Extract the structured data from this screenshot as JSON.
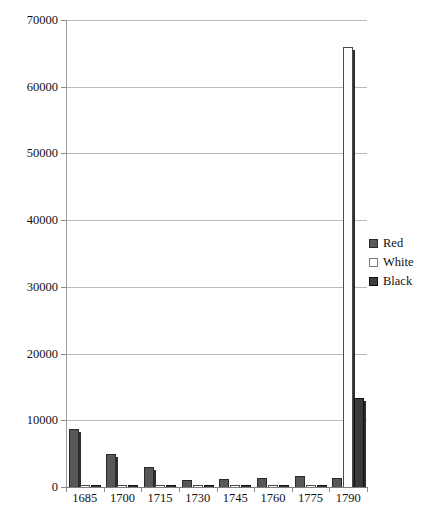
{
  "chart_data": {
    "type": "bar",
    "title": "",
    "subtitle": "",
    "xlabel": "",
    "ylabel": "",
    "categories": [
      "1685",
      "1700",
      "1715",
      "1730",
      "1745",
      "1760",
      "1775",
      "1790"
    ],
    "series": [
      {
        "name": "Red",
        "color": "#575757",
        "values": [
          8700,
          5000,
          3000,
          1000,
          1200,
          1400,
          1700,
          1300
        ]
      },
      {
        "name": "White",
        "color": "#fdfdfd",
        "values": [
          250,
          200,
          150,
          120,
          150,
          200,
          250,
          66000
        ]
      },
      {
        "name": "Black",
        "color": "#3a3a3a",
        "values": [
          150,
          120,
          100,
          150,
          200,
          250,
          300,
          13300
        ]
      }
    ],
    "ylim": [
      0,
      70000
    ],
    "ytick_step": 10000,
    "yticks": [
      "0",
      "10000",
      "20000",
      "30000",
      "40000",
      "50000",
      "60000",
      "70000"
    ],
    "grid": true,
    "legend_position": "right"
  },
  "legend": {
    "items": [
      {
        "label": "Red",
        "swatch": "legend-swatch-red"
      },
      {
        "label": "White",
        "swatch": "legend-swatch-white"
      },
      {
        "label": "Black",
        "swatch": "legend-swatch-black"
      }
    ]
  }
}
